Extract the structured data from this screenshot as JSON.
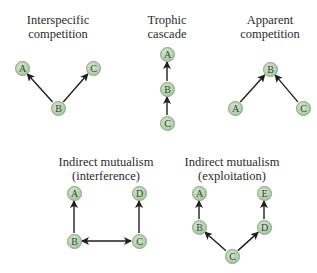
{
  "diagrams": [
    {
      "title_line1": "Interspecific",
      "title_line2": "competition",
      "nodes": [
        {
          "label": "A",
          "x": 22,
          "y": 68
        },
        {
          "label": "C",
          "x": 93,
          "y": 68
        },
        {
          "label": "B",
          "x": 58,
          "y": 108
        }
      ],
      "edges": [
        {
          "from": "B",
          "to": "A",
          "type": "arrow"
        },
        {
          "from": "B",
          "to": "C",
          "type": "arrow"
        }
      ]
    },
    {
      "title_line1": "Trophic",
      "title_line2": "cascade",
      "nodes": [
        {
          "label": "A",
          "x": 167,
          "y": 54
        },
        {
          "label": "B",
          "x": 167,
          "y": 89
        },
        {
          "label": "C",
          "x": 167,
          "y": 123
        }
      ],
      "edges": [
        {
          "from": "B",
          "to": "A",
          "type": "arrow"
        },
        {
          "from": "C",
          "to": "B",
          "type": "arrow"
        }
      ]
    },
    {
      "title_line1": "Apparent",
      "title_line2": "competition",
      "nodes": [
        {
          "label": "B",
          "x": 270,
          "y": 69
        },
        {
          "label": "A",
          "x": 235,
          "y": 108
        },
        {
          "label": "C",
          "x": 303,
          "y": 108
        }
      ],
      "edges": [
        {
          "from": "A",
          "to": "B",
          "type": "arrow"
        },
        {
          "from": "C",
          "to": "B",
          "type": "arrow"
        }
      ]
    },
    {
      "title_line1": "Indirect mutualism",
      "title_line2": "(interference)",
      "nodes": [
        {
          "label": "A",
          "x": 74,
          "y": 193
        },
        {
          "label": "D",
          "x": 139,
          "y": 193
        },
        {
          "label": "B",
          "x": 74,
          "y": 241
        },
        {
          "label": "C",
          "x": 139,
          "y": 241
        }
      ],
      "edges": [
        {
          "from": "B",
          "to": "A",
          "type": "arrow"
        },
        {
          "from": "C",
          "to": "D",
          "type": "arrow"
        },
        {
          "from": "B",
          "to": "C",
          "type": "double-arrow"
        }
      ]
    },
    {
      "title_line1": "Indirect mutualism",
      "title_line2": "(exploitation)",
      "nodes": [
        {
          "label": "A",
          "x": 199,
          "y": 193
        },
        {
          "label": "E",
          "x": 264,
          "y": 193
        },
        {
          "label": "B",
          "x": 199,
          "y": 227
        },
        {
          "label": "D",
          "x": 264,
          "y": 227
        },
        {
          "label": "C",
          "x": 232,
          "y": 256
        }
      ],
      "edges": [
        {
          "from": "B",
          "to": "A",
          "type": "arrow"
        },
        {
          "from": "D",
          "to": "E",
          "type": "arrow"
        },
        {
          "from": "C",
          "to": "B",
          "type": "arrow"
        },
        {
          "from": "C",
          "to": "D",
          "type": "arrow"
        }
      ]
    }
  ],
  "colors": {
    "node_fill": "#b2d0ac",
    "node_border": "#7ea678",
    "edge": "#1e1e1e",
    "text": "#2b2b2b"
  }
}
